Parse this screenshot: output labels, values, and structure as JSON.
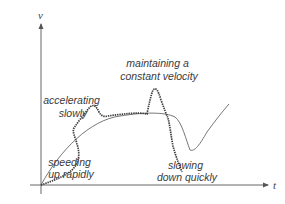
{
  "diagram": {
    "type": "velocity-time graph",
    "axes": {
      "y_label": "v",
      "x_label": "t"
    },
    "curves": [
      {
        "name": "reference-velocity-curve",
        "style": "thin solid"
      },
      {
        "name": "motion-description-curve",
        "style": "thick dotted"
      }
    ],
    "annotations": [
      {
        "id": "accelerating-slowly",
        "lines": [
          "accelerating",
          "slowly"
        ]
      },
      {
        "id": "speeding-up-rapidly",
        "lines": [
          "speeding",
          "up rapidly"
        ]
      },
      {
        "id": "maintaining-constant-velocity",
        "lines": [
          "maintaining a",
          "constant velocity"
        ]
      },
      {
        "id": "slowing-down-quickly",
        "lines": [
          "slowing",
          "down quickly"
        ]
      }
    ],
    "colors": {
      "line": "#555555",
      "dotted": "#3c3c3c",
      "text": "#3a3a3a"
    }
  }
}
